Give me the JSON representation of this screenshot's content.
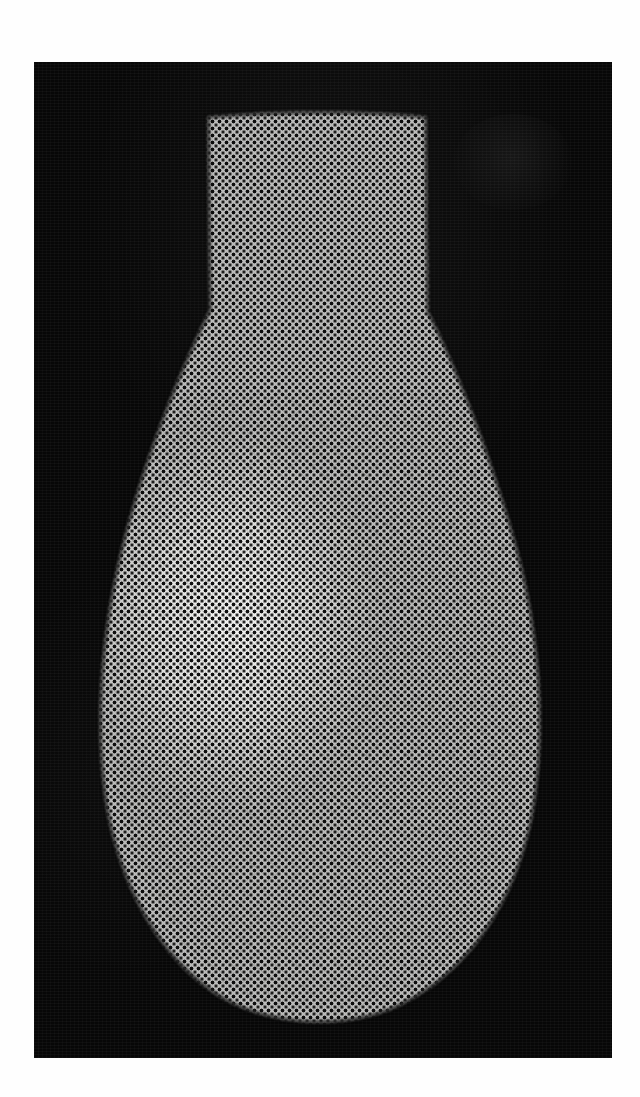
{
  "page": {
    "medium": "halftone-printed-photograph",
    "background_color": "#fefefe",
    "plate_color": "#070707",
    "ink_color": "#111111",
    "paper_color": "#f4f4f2"
  },
  "plate": {
    "x": 34,
    "y": 62,
    "width": 578,
    "height": 996
  },
  "subject": {
    "name": "bulb-vase-silhouette",
    "description": "Light-bulb / vase form: narrow straight neck at top widening into a large rounded bowl",
    "neck_top_y": 55,
    "neck_left_x": 174,
    "neck_right_x": 394,
    "widest_left_x": 68,
    "widest_right_x": 506,
    "widest_y": 730,
    "bottom_y": 960,
    "silhouette_path": "M 174 55 L 176 248 C 150 300 112 390 88 486 C 66 576 62 662 70 726 C 80 812 122 898 192 938 C 240 964 312 968 364 944 C 438 910 486 832 500 742 C 512 664 506 572 482 484 C 456 390 420 300 394 250 L 392 55 C 392 55 300 44 174 55 Z",
    "bowl_path": "M 150 330 C 112 402 80 500 72 610 C 66 708 96 820 160 898 C 224 972 352 972 418 898 C 482 824 510 706 502 608 C 494 498 464 400 424 330 Z"
  },
  "halftone": {
    "dot_pitch_px": 7,
    "dot_radius_px": 1.55,
    "screen_angle_deg": 45,
    "pattern": "orthogonal-dot-screen-with-offset-rows"
  },
  "tones": {
    "highlight_primary": {
      "cx": 196,
      "cy": 560,
      "label": "upper-left specular highlight"
    },
    "highlight_secondary": {
      "cx": 300,
      "cy": 790,
      "label": "lower-centre soft highlight"
    },
    "shadow_side": "right",
    "bowl_weave_angles_deg": [
      38,
      -38
    ]
  },
  "artifacts": {
    "ghost_blob": {
      "name": "faint-circular-offset-impression",
      "x": 420,
      "y": 52,
      "width": 118,
      "height": 96
    }
  }
}
